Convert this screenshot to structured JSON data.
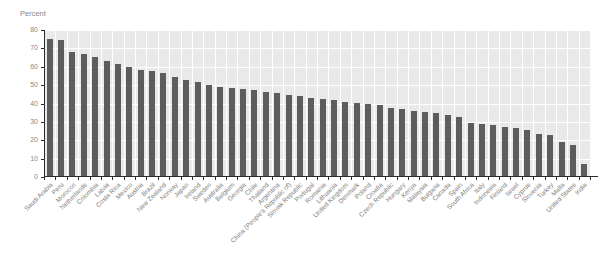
{
  "chart_data": {
    "type": "bar",
    "title": "",
    "ylabel": "Percent",
    "xlabel": "",
    "ylim": [
      0,
      80
    ],
    "yticks": [
      0,
      10,
      20,
      30,
      40,
      50,
      60,
      70,
      80
    ],
    "grid": true,
    "legend_position": "none",
    "bar_color": "#5b5d5f",
    "plot_background": "#e9e9e9",
    "gridline_color": "#ffffff",
    "categories": [
      "Saudi Arabia",
      "Peru",
      "Morocco",
      "Netherlands",
      "Colombia",
      "Latvia",
      "Costa Rica",
      "Mexico",
      "Austria",
      "Brazil",
      "New Zealand",
      "Norway",
      "Japan",
      "Ireland",
      "Sweden",
      "Australia",
      "Belgium",
      "Georgia",
      "Chile",
      "Thailand",
      "Argentina",
      "China (People's Republic of)",
      "Slovak Republic",
      "Portugal",
      "Romania",
      "Lithuania",
      "United Kingdom",
      "Denmark",
      "Poland",
      "Croatia",
      "Czech Republic",
      "Hungary",
      "Kenya",
      "Malaysia",
      "Bulgaria",
      "Canada",
      "Spain",
      "South Africa",
      "Italy",
      "Indonesia",
      "Finland",
      "Israel",
      "Cyprus",
      "Slovenia",
      "Turkey",
      "Malta",
      "United States",
      "India"
    ],
    "values": [
      75,
      74.5,
      68,
      67,
      65.5,
      63,
      61.5,
      60,
      58.5,
      57.5,
      56.5,
      54.5,
      53,
      51.5,
      50,
      49,
      48.5,
      48,
      47.5,
      46.5,
      45.5,
      44.5,
      44,
      43,
      42.5,
      42,
      41,
      40.5,
      39.5,
      39,
      37.5,
      37,
      36,
      35.5,
      35,
      34,
      32.5,
      29.5,
      29,
      28.5,
      27,
      26.5,
      25.5,
      23.5,
      23,
      19,
      17.5,
      7
    ]
  }
}
